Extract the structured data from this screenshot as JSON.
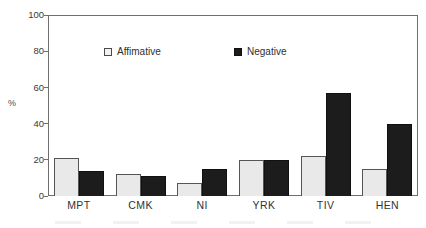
{
  "chart_data": {
    "type": "bar",
    "title": "",
    "subtitle": "",
    "xlabel": "",
    "ylabel": "%",
    "ylim": [
      0,
      100
    ],
    "yticks": [
      0,
      20,
      40,
      60,
      80,
      100
    ],
    "ytick_labels": [
      "0",
      "20",
      "40",
      "60",
      "80",
      "100"
    ],
    "grid": false,
    "legend_position": "inside-top-center",
    "categories": [
      "MPT",
      "CMK",
      "NI",
      "YRK",
      "TIV",
      "HEN"
    ],
    "series": [
      {
        "name": "Affimative",
        "color": "#e9e9e9",
        "edge_color": "#555555",
        "values": [
          21,
          12,
          7,
          20,
          22,
          15
        ]
      },
      {
        "name": "Negative",
        "color": "#1c1c1c",
        "edge_color": "#101010",
        "values": [
          14,
          11,
          15,
          20,
          57,
          40
        ]
      }
    ],
    "annotations": []
  },
  "axes": {
    "y_title": "%",
    "y_ticks": [
      {
        "label": "100",
        "value": 100
      },
      {
        "label": "80",
        "value": 80
      },
      {
        "label": "60",
        "value": 60
      },
      {
        "label": "40",
        "value": 40
      },
      {
        "label": "20",
        "value": 20
      },
      {
        "label": "0",
        "value": 0
      }
    ],
    "x_categories": [
      "MPT",
      "CMK",
      "NI",
      "YRK",
      "TIV",
      "HEN"
    ]
  },
  "legend": {
    "affirmative_label": "Affimative",
    "negative_label": "Negative"
  },
  "colors": {
    "affirmative_fill": "#e9e9e9",
    "negative_fill": "#1c1c1c",
    "frame": "#6f6f6f",
    "text": "#2b2b2b",
    "background": "#ffffff"
  }
}
